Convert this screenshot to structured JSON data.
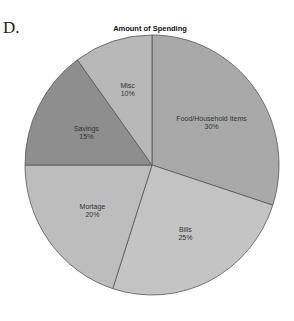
{
  "figure_label": "D.",
  "chart_data": {
    "type": "pie",
    "title": "Amount of Spending",
    "start_angle_deg": 0,
    "direction": "clockwise",
    "slices": [
      {
        "label": "Food/Household Items",
        "value": 30,
        "pct_label": "30%",
        "color": "#a9a9a9"
      },
      {
        "label": "Bills",
        "value": 25,
        "pct_label": "25%",
        "color": "#c4c4c4"
      },
      {
        "label": "Mortage",
        "value": 20,
        "pct_label": "20%",
        "color": "#bdbdbd"
      },
      {
        "label": "Savings",
        "value": 15,
        "pct_label": "15%",
        "color": "#8e8e8e"
      },
      {
        "label": "Misc",
        "value": 10,
        "pct_label": "10%",
        "color": "#b8b8b8"
      }
    ],
    "legend": "none"
  }
}
